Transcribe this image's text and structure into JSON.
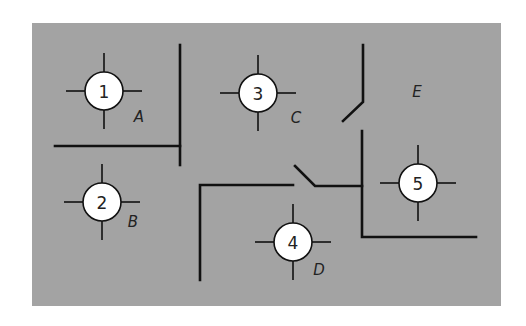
{
  "diagram": {
    "panel_color": "#a3a3a3",
    "nodes": [
      {
        "id": "1",
        "label": "1",
        "cx": 104,
        "cy": 91
      },
      {
        "id": "2",
        "label": "2",
        "cx": 102,
        "cy": 202
      },
      {
        "id": "3",
        "label": "3",
        "cx": 258,
        "cy": 93
      },
      {
        "id": "4",
        "label": "4",
        "cx": 293,
        "cy": 242
      },
      {
        "id": "5",
        "label": "5",
        "cx": 418,
        "cy": 183
      }
    ],
    "rooms": [
      {
        "label": "A",
        "x": 139,
        "y": 117
      },
      {
        "label": "B",
        "x": 133,
        "y": 222
      },
      {
        "label": "C",
        "x": 296,
        "y": 118
      },
      {
        "label": "D",
        "x": 319,
        "y": 270
      },
      {
        "label": "E",
        "x": 417,
        "y": 92
      }
    ]
  }
}
